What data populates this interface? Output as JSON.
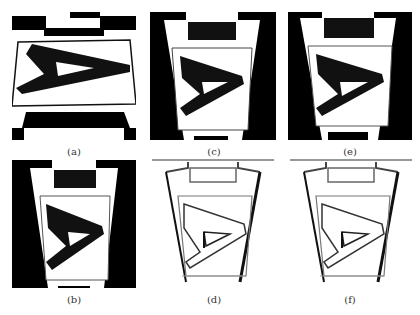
{
  "figure": {
    "panels": [
      {
        "id": "a",
        "label": "(a)",
        "description": "Top view of planar target with letter A, checkerboard border"
      },
      {
        "id": "c",
        "label": "(c)",
        "description": "Perspective-warped target with letter A"
      },
      {
        "id": "e",
        "label": "(e)",
        "description": "Perspective-warped target with letter A"
      },
      {
        "id": "b",
        "label": "(b)",
        "description": "Perspective-warped target with letter A"
      },
      {
        "id": "d",
        "label": "(d)",
        "description": "Edge/outline view of warped target with letter A"
      },
      {
        "id": "f",
        "label": "(f)",
        "description": "Edge/outline view of warped target with letter A"
      }
    ]
  }
}
